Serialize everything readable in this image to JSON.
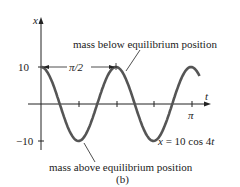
{
  "chart_data": {
    "type": "line",
    "equation": "x = 10 cos 4t",
    "xlabel": "t",
    "ylabel": "x",
    "y_ticks": [
      "10",
      "-10"
    ],
    "x_ticks": [
      "π"
    ],
    "ylim": [
      -10,
      10
    ],
    "xlim": [
      0,
      3.3
    ],
    "period_label": "π/2",
    "series": [
      {
        "name": "x = 10 cos 4t",
        "amplitude": 10,
        "angular_frequency": 4
      }
    ],
    "annotations": [
      "mass below equilibrium position",
      "mass above equilibrium position"
    ],
    "caption": "(b)"
  },
  "labels": {
    "y_axis": "x",
    "t_axis": "t",
    "y_pos": "10",
    "y_neg": "−10",
    "pi": "π",
    "period": "π/2",
    "below": "mass below equilibrium position",
    "above": "mass above equilibrium position",
    "eq_lhs": "x",
    "eq_rhs": " = 10 cos 4",
    "eq_t": "t",
    "caption": "(b)"
  }
}
